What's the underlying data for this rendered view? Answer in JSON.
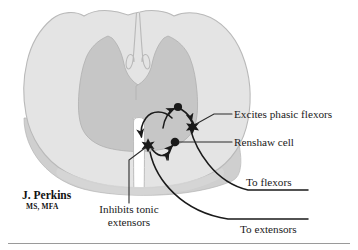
{
  "colors": {
    "white_matter": "#e4e4e4",
    "white_matter_edge": "#b9b9b9",
    "gray_matter": "#c6c6c6",
    "gray_matter_edge": "#b0b0b0",
    "shadow": "#cfcfcf",
    "ink": "#1a1a1a",
    "leader": "#2b2b2b",
    "background": "#ffffff",
    "rule": "#9a9a9a"
  },
  "labels": {
    "excites_phasic_flexors": "Excites phasic flexors",
    "renshaw_cell": "Renshaw cell",
    "to_flexors": "To flexors",
    "to_extensors": "To extensors",
    "inhibits_tonic_line1": "Inhibits tonic",
    "inhibits_tonic_line2": "extensors"
  },
  "signature": {
    "name": "J. Perkins",
    "credentials": "MS, MFA"
  },
  "anatomy": {
    "white_matter_name": "white-matter",
    "gray_matter_name": "gray-matter-butterfly",
    "dorsal_sulcus_name": "dorsal-median-sulcus",
    "ventral_fissure_name": "ventral-median-fissure",
    "central_canal_name": "central-canal"
  },
  "circuit": {
    "nodes": [
      {
        "id": "interneuron-upper",
        "type": "circle",
        "cx": 178,
        "cy": 107,
        "r": 4.1,
        "label": "excitatory interneuron"
      },
      {
        "id": "renshaw-cell",
        "type": "circle",
        "cx": 175,
        "cy": 142,
        "r": 4.3,
        "label": "Renshaw cell"
      },
      {
        "id": "motor-neuron-flexor",
        "type": "star",
        "cx": 192.5,
        "cy": 126,
        "r": 5.6,
        "label": "phasic flexor motor neuron"
      },
      {
        "id": "motor-neuron-extensor",
        "type": "star",
        "cx": 148,
        "cy": 144.5,
        "r": 5.6,
        "label": "tonic extensor motor neuron"
      }
    ],
    "arrow_count": 5,
    "axons": [
      "to-flexors-axon",
      "to-extensors-axon"
    ]
  }
}
